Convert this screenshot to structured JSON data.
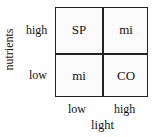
{
  "diagram": {
    "x_axis": {
      "title": "light",
      "ticks": [
        "low",
        "high"
      ]
    },
    "y_axis": {
      "title": "nutrients",
      "ticks": [
        "high",
        "low"
      ]
    },
    "cells": [
      [
        "SP",
        "mi"
      ],
      [
        "mi",
        "CO"
      ]
    ]
  }
}
